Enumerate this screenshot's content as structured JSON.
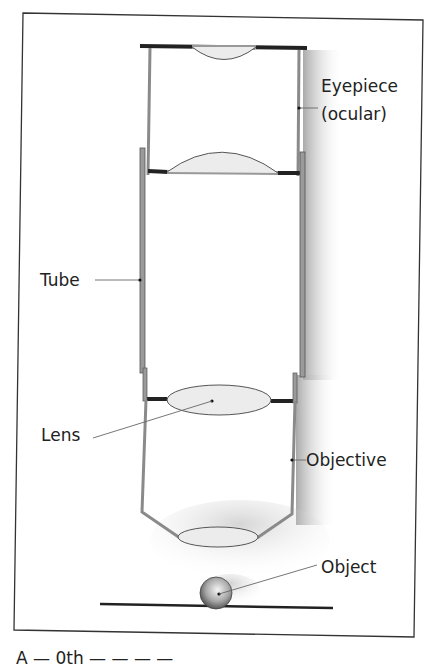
{
  "diagram": {
    "labels": {
      "eyepiece_line1": "Eyepiece",
      "eyepiece_line2": "(ocular)",
      "tube": "Tube",
      "lens": "Lens",
      "objective": "Objective",
      "object": "Object"
    },
    "caption": "A — 0th — — — —"
  },
  "colors": {
    "frame": "#333333",
    "tube_wall": "#8a8a8a",
    "lens_fill": "#ececec",
    "lens_stroke": "#666666",
    "shadow": "#b0b0b0",
    "text": "#222222"
  }
}
